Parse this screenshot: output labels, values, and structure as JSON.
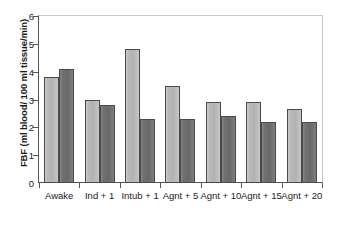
{
  "chart_data": {
    "type": "bar",
    "title": "",
    "xlabel": "",
    "ylabel": "FBF (ml blood/ 100 ml tissue/min)",
    "categories": [
      "Awake",
      "Ind + 1",
      "Intub + 1",
      "Agnt + 5",
      "Agnt + 10",
      "Agnt + 15",
      "Agnt + 20"
    ],
    "series": [
      {
        "name": "series-1",
        "color": "#b9b9b9",
        "values": [
          3.8,
          3.0,
          4.8,
          3.5,
          2.9,
          2.9,
          2.65
        ]
      },
      {
        "name": "series-2",
        "color": "#707070",
        "values": [
          4.1,
          2.8,
          2.3,
          2.3,
          2.4,
          2.2,
          2.2
        ]
      }
    ],
    "ylim": [
      0,
      6
    ],
    "yticks": [
      "0",
      "1",
      "2",
      "3",
      "4",
      "5",
      "6"
    ],
    "ytick_values": [
      0,
      1,
      2,
      3,
      4,
      5,
      6
    ],
    "grid": false,
    "legend": "none"
  },
  "axis": {
    "y_title": "FBF (ml blood/ 100 ml tissue/min)"
  }
}
